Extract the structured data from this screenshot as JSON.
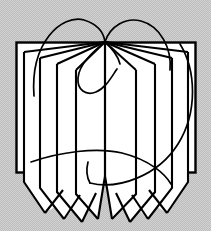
{
  "image": {
    "kind": "logo-emblem",
    "subject": "open-book-with-fanned-pages",
    "title": "Open Book Emblem",
    "width": 211,
    "height": 231
  },
  "colors": {
    "background": "#d2d2d2",
    "background_dither": "#bdbdbd",
    "page": "#ffffff",
    "ink": "#000000"
  },
  "geometry": {
    "spine_top_x": 105,
    "spine_top_y": 42,
    "spine_bottom_y": 172,
    "cover_left_x": 16,
    "cover_right_x": 196,
    "cover_top_y": 42,
    "cover_bottom_y": 172
  },
  "elements": {
    "background_label": "halftone-gray-field",
    "cover_label": "book-cover-rectangle",
    "spine_label": "center-spine",
    "left_pages_label": "left-page-leaves",
    "right_pages_label": "right-page-leaves",
    "pennant_label": "notched-page-tails",
    "small_arcs_label": "twin-crown-arcs",
    "large_arc_label": "sweeping-ellipse-arc",
    "inner_arc_label": "inner-spiral-arc"
  }
}
